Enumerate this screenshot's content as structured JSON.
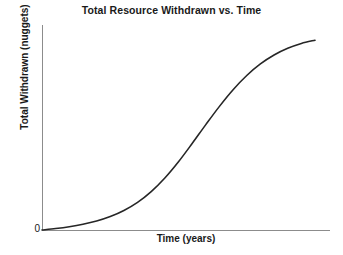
{
  "chart_data": {
    "type": "line",
    "title": "Total Resource Withdrawn vs. Time",
    "xlabel": "Time (years)",
    "ylabel": "Total Withdrawn (nuggets)",
    "origin_label": "0",
    "grid": false,
    "legend": null,
    "axis_color": "#8c8c8c",
    "curve_color": "#262626",
    "xlim": [
      0,
      100
    ],
    "ylim": [
      0,
      100
    ],
    "x_tick_labels": [],
    "y_tick_labels": [
      "0"
    ],
    "series": [
      {
        "name": "Total Withdrawn",
        "shape": "sigmoid",
        "x": [
          0,
          5,
          10,
          15,
          20,
          25,
          30,
          35,
          40,
          45,
          50,
          55,
          60,
          65,
          70,
          75,
          80,
          85,
          90,
          95,
          100
        ],
        "y": [
          0,
          0.7,
          1.6,
          2.8,
          4.4,
          6.6,
          9.6,
          13.6,
          18.9,
          25.6,
          33.6,
          42.6,
          51.9,
          60.9,
          69.1,
          76.1,
          81.8,
          86.2,
          89.5,
          91.9,
          93.5
        ]
      }
    ]
  }
}
